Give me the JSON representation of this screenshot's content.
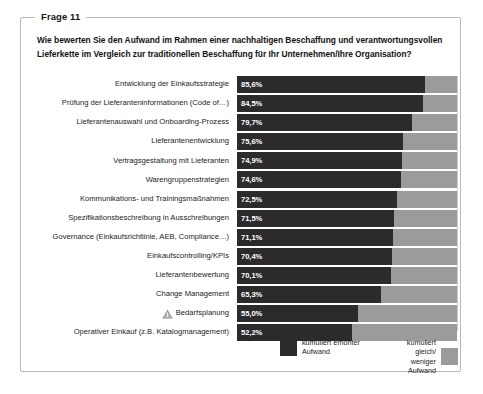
{
  "card": {
    "legend_label": "Frage 11",
    "question": "Wie bewerten Sie den Aufwand im Rahmen einer nachhaltigen Beschaffung und verantwortungsvollen Lieferkette im Vergleich zur traditionellen Beschaffung für Ihr Unternehmen/Ihre Organisation?"
  },
  "legend": {
    "series_dark_label": "kumuliert erhöhter\nAufwand",
    "series_gray_label": "kumuliert gleich/\nweniger Aufwand",
    "dark_color": "#2b2b2b",
    "gray_color": "#9b9b9b"
  },
  "icons": {
    "warning": "warning-triangle-icon"
  },
  "chart_data": {
    "type": "bar",
    "orientation": "horizontal",
    "stacked": true,
    "title": "",
    "xlabel": "",
    "ylabel": "",
    "xlim": [
      0,
      100
    ],
    "grid": false,
    "legend_position": "bottom",
    "categories": [
      "Entwicklung der Einkaufsstrategie",
      "Prüfung der Lieferanteninformationen (Code of…)",
      "Lieferantenauswahl und Onboarding-Prozess",
      "Lieferantenentwicklung",
      "Vertragsgestaltung mit Lieferanten",
      "Warengruppenstrategien",
      "Kommunikations- und Trainingsmaßnahmen",
      "Spezifikationsbeschreibung in Ausschreibungen",
      "Governance (Einkaufsrichtlinie, AEB, Compliance…)",
      "Einkaufscontrolling/KPIs",
      "Lieferantenbewertung",
      "Change Management",
      "Bedarfsplanung",
      "Operativer Einkauf (z.B. Katalogmanagement)"
    ],
    "series": [
      {
        "name": "kumuliert erhöhter Aufwand",
        "color": "#2b2b2b",
        "values": [
          85.6,
          84.5,
          79.7,
          75.6,
          74.9,
          74.6,
          72.5,
          71.5,
          71.1,
          70.4,
          70.1,
          65.3,
          55.0,
          52.2
        ],
        "labels": [
          "85,6%",
          "84,5%",
          "79,7%",
          "75,6%",
          "74,9%",
          "74,6%",
          "72,5%",
          "71,5%",
          "71,1%",
          "70,4%",
          "70,1%",
          "65,3%",
          "55,0%",
          "52,2%"
        ]
      },
      {
        "name": "kumuliert gleich/ weniger Aufwand",
        "color": "#9b9b9b",
        "values": [
          14.4,
          15.5,
          20.3,
          24.4,
          25.1,
          25.4,
          27.5,
          28.5,
          28.9,
          29.6,
          29.9,
          34.7,
          45.0,
          47.8
        ],
        "labels": []
      }
    ],
    "annotated_categories": [
      "Bedarfsplanung"
    ]
  }
}
